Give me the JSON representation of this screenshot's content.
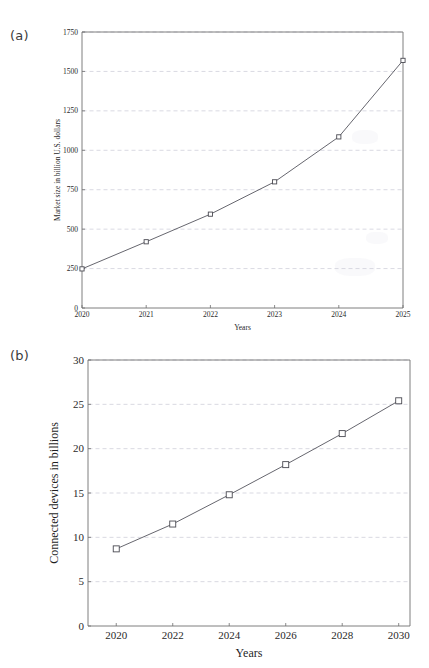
{
  "figure": {
    "panels": [
      {
        "id": "a",
        "label": "(a)",
        "label_name": "panel-label-a"
      },
      {
        "id": "b",
        "label": "(b)",
        "label_name": "panel-label-b"
      }
    ]
  },
  "chart_data": [
    {
      "type": "line",
      "panel": "(a)",
      "title": "",
      "xlabel": "Years",
      "ylabel": "Market size in billion U.S. dollars",
      "x": [
        2020,
        2021,
        2022,
        2023,
        2024,
        2025
      ],
      "values": [
        248,
        420,
        595,
        800,
        1085,
        1570
      ],
      "xtick_labels": [
        "2020",
        "2021",
        "2022",
        "2023",
        "2024",
        "2025"
      ],
      "ytick_labels": [
        "0",
        "250",
        "500",
        "750",
        "1000",
        "1250",
        "1500",
        "1750"
      ],
      "yticks": [
        0,
        250,
        500,
        750,
        1000,
        1250,
        1500,
        1750
      ],
      "xlim": [
        2020,
        2025
      ],
      "ylim": [
        0,
        1750
      ],
      "grid": true,
      "grid_axis": "y",
      "legend": "none",
      "marker": "square-open",
      "series_name": "Market size"
    },
    {
      "type": "line",
      "panel": "(b)",
      "title": "",
      "xlabel": "Years",
      "ylabel": "Connected devices in billions",
      "x": [
        2020,
        2022,
        2024,
        2026,
        2028,
        2030
      ],
      "values": [
        8.7,
        11.5,
        14.8,
        18.2,
        21.7,
        25.4
      ],
      "xtick_labels": [
        "2020",
        "2022",
        "2024",
        "2026",
        "2028",
        "2030"
      ],
      "ytick_labels": [
        "0",
        "5",
        "10",
        "15",
        "20",
        "25",
        "30"
      ],
      "yticks": [
        0,
        5,
        10,
        15,
        20,
        25,
        30
      ],
      "xlim": [
        2019,
        2030.4
      ],
      "ylim": [
        0,
        30
      ],
      "grid": true,
      "grid_axis": "y",
      "legend": "none",
      "marker": "square-open",
      "series_name": "Connected devices"
    }
  ]
}
